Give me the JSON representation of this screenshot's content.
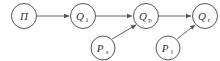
{
  "diagram": {
    "type": "flow-graph",
    "nodes": [
      {
        "id": "pi",
        "label": "Π",
        "sub": "",
        "cx": 24,
        "cy": 16
      },
      {
        "id": "q1",
        "label": "Q",
        "sub": "1",
        "cx": 83,
        "cy": 16
      },
      {
        "id": "qp",
        "label": "Q",
        "sub": "p",
        "cx": 146,
        "cy": 16
      },
      {
        "id": "qr",
        "label": "Q",
        "sub": "r",
        "cx": 205,
        "cy": 16
      },
      {
        "id": "ps",
        "label": "P",
        "sub": "s",
        "cx": 103,
        "cy": 48
      },
      {
        "id": "pl",
        "label": "P",
        "sub": "l",
        "cx": 168,
        "cy": 48
      }
    ],
    "edges": [
      {
        "from": "pi",
        "to": "q1"
      },
      {
        "from": "q1",
        "to": "qp"
      },
      {
        "from": "ps",
        "to": "qp"
      },
      {
        "from": "qp",
        "to": "qr"
      },
      {
        "from": "pl",
        "to": "qr"
      }
    ],
    "colors": {
      "stroke": "#555555",
      "text": "#333333",
      "background": "#ffffff"
    }
  }
}
